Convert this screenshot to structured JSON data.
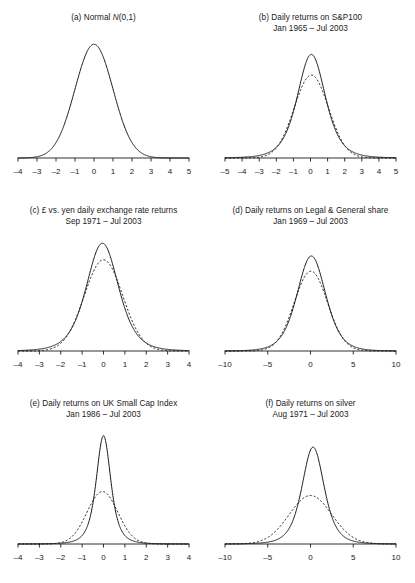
{
  "figure": {
    "name": "density-comparison-figure",
    "background": "#ffffff",
    "ink_color": "#1a1a1a",
    "panel_count": 6,
    "columns": 2,
    "rows": 3
  },
  "chart_data": [
    {
      "type": "line",
      "panel": "a",
      "title": "(a) Normal N(0,1)",
      "title_lines": [
        "(a) Normal N(0,1)"
      ],
      "title_prefix": "(a) Normal ",
      "title_italic": "N",
      "title_suffix": "(0,1)",
      "subtitle": "",
      "xlabel": "",
      "ylabel": "",
      "xlim": [
        -4,
        5
      ],
      "ylim": [
        0,
        0.4
      ],
      "grid": false,
      "legend": "none",
      "ticks": [
        "-4",
        "-3",
        "-2",
        "-1",
        "0",
        "1",
        "2",
        "3",
        "4",
        "5"
      ],
      "tick_values": [
        -4,
        -3,
        -2,
        -1,
        0,
        1,
        2,
        3,
        4,
        5
      ],
      "series": [
        {
          "name": "Normal density",
          "style": "solid",
          "distribution": "normal",
          "mean": 0,
          "sd": 1,
          "peak": 0.399
        }
      ]
    },
    {
      "type": "line",
      "panel": "b",
      "title": "(b) Daily returns on S&P100",
      "title_lines": [
        "(b) Daily returns on S&P100",
        "Jan 1965 – Jul 2003"
      ],
      "subtitle": "Jan 1965 – Jul 2003",
      "xlabel": "",
      "ylabel": "",
      "xlim": [
        -5,
        5
      ],
      "ylim": [
        0,
        0.55
      ],
      "grid": false,
      "legend": "none",
      "ticks": [
        "-5",
        "-4",
        "-3",
        "-2",
        "-1",
        "0",
        "1",
        "2",
        "3",
        "4",
        "5"
      ],
      "tick_values": [
        -5,
        -4,
        -3,
        -2,
        -1,
        0,
        1,
        2,
        3,
        4,
        5
      ],
      "series": [
        {
          "name": "Empirical density of returns",
          "style": "solid",
          "distribution": "student-t",
          "mean": 0.05,
          "sd": 0.85,
          "tail_weight": 4.5,
          "peak": 0.5
        },
        {
          "name": "Fitted normal density",
          "style": "dashed",
          "distribution": "normal",
          "mean": 0.05,
          "sd": 1.0,
          "peak": 0.4
        }
      ]
    },
    {
      "type": "line",
      "panel": "c",
      "title": "(c) £ vs. yen daily exchange rate returns",
      "title_lines": [
        "(c) £ vs. yen daily exchange rate returns",
        "Sep 1971 – Jul 2003"
      ],
      "subtitle": "Sep 1971 – Jul 2003",
      "xlabel": "",
      "ylabel": "",
      "xlim": [
        -4,
        4
      ],
      "ylim": [
        0,
        0.55
      ],
      "grid": false,
      "legend": "none",
      "ticks": [
        "-4",
        "-3",
        "-2",
        "-1",
        "0",
        "1",
        "2",
        "3",
        "4"
      ],
      "tick_values": [
        -4,
        -3,
        -2,
        -1,
        0,
        1,
        2,
        3,
        4
      ],
      "series": [
        {
          "name": "Empirical density of returns",
          "style": "solid",
          "distribution": "student-t",
          "mean": -0.05,
          "sd": 0.78,
          "tail_weight": 5.0,
          "peak": 0.52
        },
        {
          "name": "Fitted normal density",
          "style": "dashed",
          "distribution": "normal",
          "mean": 0.0,
          "sd": 0.9,
          "peak": 0.44
        }
      ]
    },
    {
      "type": "line",
      "panel": "d",
      "title": "(d) Daily returns on Legal & General share",
      "title_lines": [
        "(d) Daily returns on Legal & General share",
        "Jan 1969 – Jul 2003"
      ],
      "subtitle": "Jan 1969 – Jul 2003",
      "xlabel": "",
      "ylabel": "",
      "xlim": [
        -10,
        10
      ],
      "ylim": [
        0,
        0.3
      ],
      "grid": false,
      "legend": "none",
      "ticks": [
        "-10",
        "-5",
        "0",
        "5",
        "10"
      ],
      "tick_values": [
        -10,
        -5,
        0,
        5,
        10
      ],
      "series": [
        {
          "name": "Empirical density of returns",
          "style": "solid",
          "distribution": "student-t",
          "mean": 0.1,
          "sd": 1.72,
          "tail_weight": 6.0,
          "peak": 0.25
        },
        {
          "name": "Fitted normal density",
          "style": "dashed",
          "distribution": "normal",
          "mean": 0.05,
          "sd": 1.95,
          "peak": 0.21
        }
      ]
    },
    {
      "type": "line",
      "panel": "e",
      "title": "(e) Daily returns on UK Small Cap Index",
      "title_lines": [
        "(e) Daily returns on UK Small Cap Index",
        "Jan 1986 – Jul 2003"
      ],
      "subtitle": "Jan 1986 – Jul 2003",
      "xlabel": "",
      "ylabel": "",
      "xlim": [
        -4,
        4
      ],
      "ylim": [
        0,
        1.0
      ],
      "grid": false,
      "legend": "none",
      "ticks": [
        "-4",
        "-3",
        "-2",
        "-1",
        "0",
        "1",
        "2",
        "3",
        "4"
      ],
      "tick_values": [
        -4,
        -3,
        -2,
        -1,
        0,
        1,
        2,
        3,
        4
      ],
      "series": [
        {
          "name": "Empirical density of returns",
          "style": "solid",
          "distribution": "student-t",
          "mean": 0.0,
          "sd": 0.36,
          "tail_weight": 3.0,
          "peak": 0.95
        },
        {
          "name": "Fitted normal density",
          "style": "dashed",
          "distribution": "normal",
          "mean": -0.05,
          "sd": 0.72,
          "peak": 0.46
        }
      ]
    },
    {
      "type": "line",
      "panel": "f",
      "title": "(f) Daily returns on silver",
      "title_lines": [
        "(f) Daily returns on silver",
        "Aug 1971 – Jul 2003"
      ],
      "subtitle": "Aug 1971 – Jul 2003",
      "xlabel": "",
      "ylabel": "",
      "xlim": [
        -10,
        10
      ],
      "ylim": [
        0,
        0.4
      ],
      "grid": false,
      "legend": "none",
      "ticks": [
        "-10",
        "-5",
        "0",
        "5",
        "10"
      ],
      "tick_values": [
        -10,
        -5,
        0,
        5,
        10
      ],
      "series": [
        {
          "name": "Empirical density of returns",
          "style": "solid",
          "distribution": "student-t",
          "mean": 0.3,
          "sd": 1.35,
          "tail_weight": 4.0,
          "peak": 0.34
        },
        {
          "name": "Fitted normal density",
          "style": "dashed",
          "distribution": "normal",
          "mean": 0.0,
          "sd": 2.5,
          "peak": 0.17
        }
      ]
    }
  ]
}
